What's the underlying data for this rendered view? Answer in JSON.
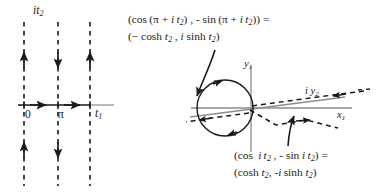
{
  "figure": {
    "background": "#ffffff",
    "ink": "#1a1a1a",
    "gray": "#8c8c8c"
  },
  "left_panel": {
    "name": "complex-t-plane-strip",
    "vertical_axis_label": "it2",
    "origin_label": "0",
    "pi_label": "π",
    "horizontal_axis_label": "t1",
    "dashed_lines": [
      {
        "x": 24,
        "label": "0",
        "above_arrow": "up",
        "below_arrow": "up"
      },
      {
        "x": 58,
        "label": "π",
        "above_arrow": "down",
        "below_arrow": "down"
      },
      {
        "x": 90,
        "label": "",
        "above_arrow": "up",
        "below_arrow": "none"
      }
    ],
    "real_axis_arrows": [
      "right",
      "right"
    ]
  },
  "right_panel": {
    "name": "unit-circle-branch-diagram",
    "vertical_axis_label": "y1",
    "horizontal_axis_label": "x1",
    "slanted_axis_label": "iy2",
    "circle_rotation_arrows": [
      "upper-left",
      "lower-right"
    ],
    "dashed_branch_arrows": [
      "left",
      "right",
      "right"
    ]
  },
  "equations": {
    "top": {
      "line1": "(cos (π + i t2) , - sin (π + i t2)) =",
      "line2": "(- cosh t2 , i sinh t2)"
    },
    "bottom": {
      "line1": "(cos  i t2 , - sin i t2) =",
      "line2": "(cosh t2, -i sinh t2)"
    }
  }
}
